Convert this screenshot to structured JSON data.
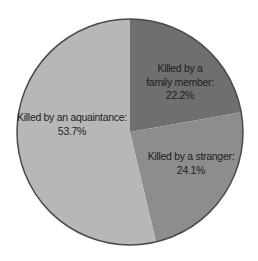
{
  "chart_data": {
    "type": "pie",
    "title": "",
    "categories": [
      "Killed by a family member",
      "Killed by a stranger",
      "Killed by an aquaintance"
    ],
    "values": [
      22.2,
      24.1,
      53.7
    ],
    "unit": "%",
    "start_angle_deg": 0,
    "direction": "clockwise",
    "colors": [
      "#6f6f6f",
      "#8d8d8d",
      "#b7b7b7"
    ],
    "outline_color": "#4a4a4a",
    "legend": "none",
    "labels": [
      {
        "line1": "Killed by a",
        "line2": "family member:",
        "value": "22.2%"
      },
      {
        "line1": "Killed by a stranger:",
        "value": "24.1%"
      },
      {
        "line1": "Killed by an aquaintance:",
        "value": "53.7%"
      }
    ]
  }
}
